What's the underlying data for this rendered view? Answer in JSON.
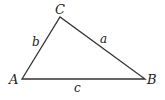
{
  "diagram": {
    "type": "triangle",
    "vertices": [
      {
        "id": "A",
        "label": "A",
        "x": 22,
        "y": 79
      },
      {
        "id": "B",
        "label": "B",
        "x": 145,
        "y": 79
      },
      {
        "id": "C",
        "label": "C",
        "x": 60,
        "y": 17
      }
    ],
    "sides": [
      {
        "id": "a",
        "label": "a",
        "from": "C",
        "to": "B"
      },
      {
        "id": "b",
        "label": "b",
        "from": "A",
        "to": "C"
      },
      {
        "id": "c",
        "label": "c",
        "from": "A",
        "to": "B"
      }
    ],
    "stroke_color": "#333333"
  }
}
